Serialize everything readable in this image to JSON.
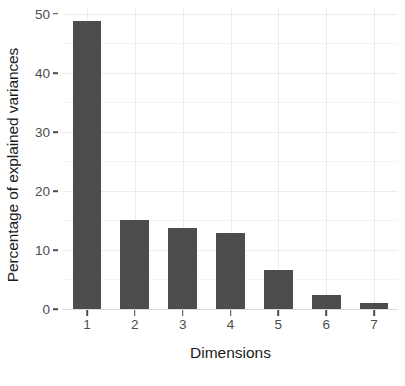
{
  "chart_data": {
    "type": "bar",
    "title": "",
    "subtitle": "",
    "xlabel": "Dimensions",
    "ylabel": "Percentage of explained variances",
    "categories": [
      "1",
      "2",
      "3",
      "4",
      "5",
      "6",
      "7"
    ],
    "values": [
      48.8,
      15.1,
      13.7,
      12.9,
      6.6,
      2.4,
      1.0
    ],
    "series": [
      {
        "name": "Percentage of explained variances",
        "values": [
          48.8,
          15.1,
          13.7,
          12.9,
          6.6,
          2.4,
          1.0
        ]
      }
    ],
    "ylim": [
      0,
      51
    ],
    "xlim": [
      0.4,
      7.6
    ],
    "y_ticks": [
      0,
      10,
      20,
      30,
      40,
      50
    ],
    "y_tick_labels": [
      "0",
      "10",
      "20",
      "30",
      "40",
      "50"
    ],
    "y_minor_ticks": [
      5,
      15,
      25,
      35,
      45
    ],
    "x_ticks": [
      "1",
      "2",
      "3",
      "4",
      "5",
      "6",
      "7"
    ],
    "grid": "major and minor horizontal, major vertical",
    "legend": "none",
    "bar_color": "#4d4d4d",
    "panel_background": "#ffffff",
    "gridline_color_major": "#ececec",
    "gridline_color_minor": "#f4f4f4",
    "axis_text_color": "#4d4d4d",
    "axis_title_color": "#1a1a1a"
  }
}
